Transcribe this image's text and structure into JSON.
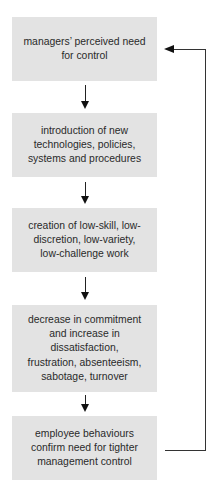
{
  "diagram": {
    "type": "flowchart-cycle",
    "boxes": [
      {
        "label": "managers’ perceived need for control"
      },
      {
        "label": "introduction of new technologies, policies, systems and procedures"
      },
      {
        "label": "creation of low-skill, low-discretion, low-variety, low-challenge work"
      },
      {
        "label": "decrease in commitment and increase in dissatisfaction, frustration, absenteeism, sabotage, turnover"
      },
      {
        "label": "employee behaviours confirm need for tighter management control"
      }
    ],
    "lines": [
      [
        "managers’ perceived need",
        "for control"
      ],
      [
        "introduction of new",
        "technologies, policies,",
        "systems and procedures"
      ],
      [
        "creation of low-skill, low-",
        "discretion, low-variety,",
        "low-challenge work"
      ],
      [
        "decrease in commitment",
        "and increase in dissatisfaction,",
        "frustration, absenteeism,",
        "sabotage, turnover"
      ],
      [
        "employee behaviours",
        "confirm need for tighter",
        "management control"
      ]
    ],
    "feedback_arrow": {
      "from": "box-5",
      "to": "box-1"
    },
    "colors": {
      "box_fill": "#e3e3e3",
      "text": "#2a2a2a",
      "arrow": "#111111"
    }
  }
}
